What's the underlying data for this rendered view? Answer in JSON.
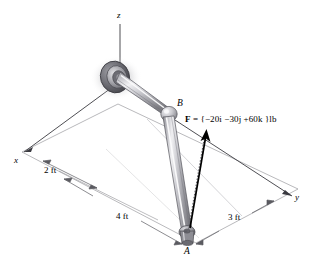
{
  "figure": {
    "type": "engineering-statics-diagram",
    "axes": {
      "z": "z",
      "x": "x",
      "y": "y"
    },
    "points": {
      "a": "A",
      "b": "B"
    },
    "dimensions": [
      {
        "id": "dim-2ft",
        "label": "2 ft"
      },
      {
        "id": "dim-4ft",
        "label": "4 ft"
      },
      {
        "id": "dim-3ft",
        "label": "3 ft"
      }
    ],
    "force": {
      "symbol": "F",
      "equals": "=",
      "value": "{−20i −30j +60k }lb",
      "full": "F = {−20i −30j +60k }lb"
    },
    "colors": {
      "line": "#000000",
      "grid": "#8a8a8f",
      "rod_light": "#e8e8ea",
      "rod_mid": "#b9b9be",
      "rod_dark": "#7d7d83",
      "joint_dark": "#4a4a50",
      "background": "#ffffff"
    }
  }
}
